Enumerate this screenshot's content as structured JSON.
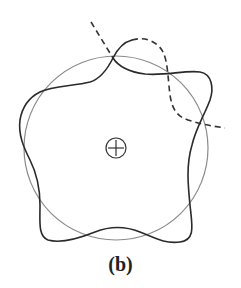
{
  "caption": "(b)",
  "colors": {
    "background": "#ffffff",
    "circle": "#8a8a8a",
    "wavy_curve": "#2a2a2a",
    "dashed_curve": "#333333",
    "center_symbol": "#333333"
  },
  "circle": {
    "cx": 116,
    "cy": 148,
    "r": 92
  },
  "center_symbol": {
    "cx": 116,
    "cy": 148,
    "r": 10,
    "glyph": "plus-in-circle"
  },
  "wavy_curve": {
    "lobes": 5,
    "base_radius": 94,
    "amplitude": 20,
    "phase_deg": 30
  },
  "solid_segments": [
    "M113,58 C118,66 130,72 145,74 C165,76 185,70 200,72 C212,74 214,88 210,100 C204,116 196,128 192,145 C186,165 188,185 190,205 C192,225 196,240 180,242 C165,244 155,238 140,232 C125,226 110,226 95,232 C80,238 62,244 48,240 C38,236 40,222 40,205 C40,188 36,172 30,160 C24,148 18,135 20,120 C22,108 28,98 40,92 C52,86 75,86 90,82 C100,79 108,68 113,58 C118,48 124,42 132,40"
  ],
  "dashed_segments": [
    "M132,40 C145,36 158,42 163,52 C168,62 168,80 170,95 C172,108 176,116 188,120 C200,124 212,126 225,128",
    "M91,22 L113,58"
  ]
}
